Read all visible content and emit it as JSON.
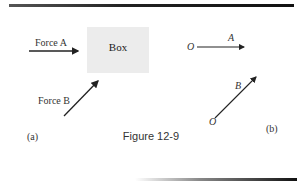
{
  "figure": {
    "caption": "Figure 12-9",
    "panel_a": {
      "label": "(a)",
      "box_label": "Box",
      "force_a_label": "Force A",
      "force_b_label": "Force B"
    },
    "panel_b": {
      "label": "(b)",
      "vector_a_label": "A",
      "vector_b_label": "B",
      "origin_a_label": "O",
      "origin_b_label": "O"
    }
  }
}
